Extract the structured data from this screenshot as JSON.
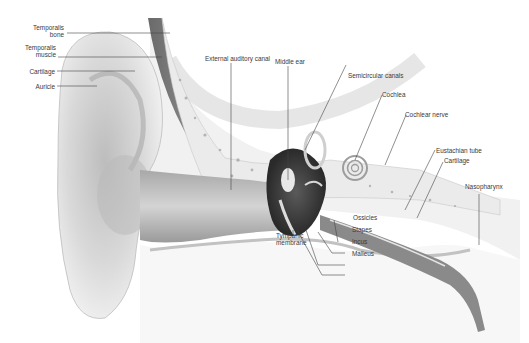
{
  "diagram": {
    "colors": {
      "ink": "#3a3a3a",
      "leader": "#444444",
      "tissue_light": "#e6e6e6",
      "tissue_mid": "#bdbdbd",
      "tissue_dark": "#4a4a4a"
    },
    "labels": {
      "temporalis_bone_1": "Temporalis",
      "temporalis_bone_2": "bone",
      "temporalis_muscle_1": "Temporalis",
      "temporalis_muscle_2": "muscle",
      "cartilage_left": "Cartilage",
      "auricle": "Auricle",
      "external_auditory_canal": "External auditory canal",
      "middle_ear": "Middle ear",
      "semicircular_canals": "Semicircular canals",
      "cochlea": "Cochlea",
      "cochlear_nerve": "Cochlear nerve",
      "eustachian_tube": "Eustachian tube",
      "cartilage_right": "Cartilage",
      "nasopharynx": "Nasopharynx",
      "ossicles": "Ossicles",
      "stapes": "Stapes",
      "incus": "Incus",
      "malleus": "Malleus",
      "tympanic_membrane_1": "Tympanic",
      "tympanic_membrane_2": "membrane"
    }
  }
}
